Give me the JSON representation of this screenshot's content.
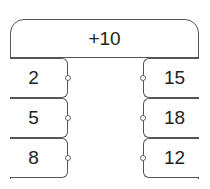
{
  "rule": "+10",
  "inputs": [
    "2",
    "5",
    "8"
  ],
  "outputs": [
    "15",
    "18",
    "12"
  ]
}
